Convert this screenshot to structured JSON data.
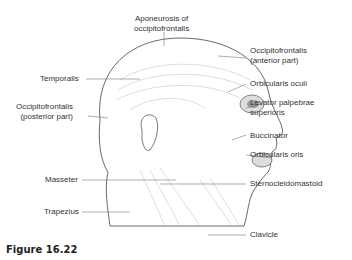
{
  "figure": {
    "caption": "Figure 16.22"
  },
  "labels": {
    "aponeurosis": [
      "Aponeurosis of",
      "occipitofrontalis"
    ],
    "temporalis": "Temporalis",
    "occ_posterior": [
      "Occipitofrontalis",
      "(posterior part)"
    ],
    "masseter": "Masseter",
    "trapezius": "Trapezius",
    "occ_anterior": [
      "Occipitofrontalis",
      "(anterior part)"
    ],
    "orbicularis_oculi": "Orbicularis oculi",
    "levator": [
      "Levator palpebrae",
      "superioris"
    ],
    "buccinator": "Buccinator",
    "orbicularis_oris": "Orbicularis oris",
    "sternocleidomastoid": "Sternocleidomastoid",
    "clavicle": "Clavicle"
  }
}
